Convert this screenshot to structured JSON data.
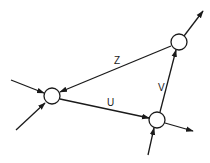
{
  "diagram": {
    "type": "directed-graph",
    "nodes": [
      {
        "id": "left",
        "cx": 52,
        "cy": 96,
        "r": 8
      },
      {
        "id": "top-right",
        "cx": 179,
        "cy": 42,
        "r": 8
      },
      {
        "id": "bottom-right",
        "cx": 157,
        "cy": 120,
        "r": 8
      }
    ],
    "edges": [
      {
        "from": "top-right",
        "to": "left",
        "label": "Z"
      },
      {
        "from": "left",
        "to": "bottom-right",
        "label": "U"
      },
      {
        "from": "bottom-right",
        "to": "top-right",
        "label": "V"
      }
    ],
    "external_inputs": 4,
    "external_outputs": 2
  },
  "labels": {
    "z": "Z",
    "u": "U",
    "v": "V"
  },
  "colors": {
    "stroke": "#1a1a1a",
    "background": "#ffffff"
  }
}
